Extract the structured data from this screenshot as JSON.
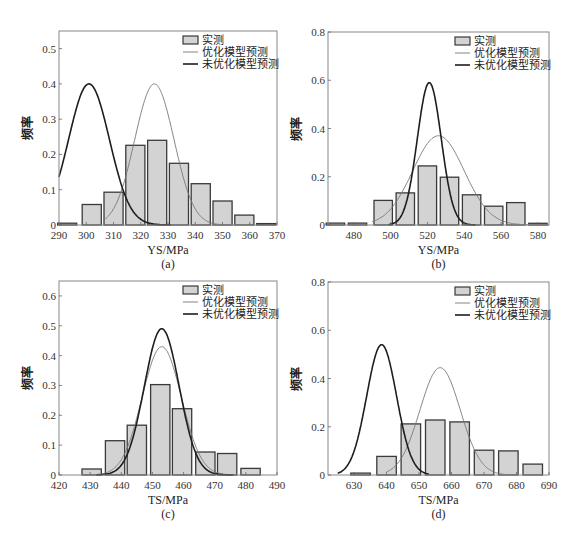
{
  "figure": {
    "legend": {
      "measured": "实测",
      "optimized": "优化模型预测",
      "unoptimized": "未优化模型预测"
    },
    "ylabel": "频率"
  },
  "chart_data": [
    {
      "id": "a",
      "type": "bar",
      "caption": "(a)",
      "xlabel": "YS/MPa",
      "ylabel": "频率",
      "xlim": [
        290,
        370
      ],
      "ylim": [
        0,
        0.55
      ],
      "xticks": [
        290,
        300,
        310,
        320,
        330,
        340,
        350,
        360,
        370
      ],
      "yticks": [
        0,
        0.1,
        0.2,
        0.3,
        0.4,
        0.5
      ],
      "ytick_labels": [
        "0",
        "0.1",
        "0.2",
        "0.3",
        "0.4",
        "0.5"
      ],
      "bar_width": 7,
      "bars": {
        "x": [
          293,
          302,
          310,
          318,
          326,
          334,
          342,
          350,
          358,
          366
        ],
        "values": [
          0.005,
          0.058,
          0.093,
          0.226,
          0.24,
          0.175,
          0.117,
          0.068,
          0.028,
          0.004
        ]
      },
      "series": [
        {
          "name": "优化模型预测",
          "type": "line",
          "mean": 325,
          "peak": 0.4,
          "sigma": 7.2,
          "range": [
            307,
            356
          ]
        },
        {
          "name": "未优化模型预测",
          "type": "line",
          "mean": 301,
          "peak": 0.4,
          "sigma": 7.5,
          "range": [
            290,
            331
          ]
        }
      ],
      "legend_position": "upper right",
      "grid": false
    },
    {
      "id": "b",
      "type": "bar",
      "caption": "(b)",
      "xlabel": "YS/MPa",
      "ylabel": "频率",
      "xlim": [
        466,
        586
      ],
      "ylim": [
        0,
        0.8
      ],
      "xticks": [
        480,
        500,
        520,
        540,
        560,
        580
      ],
      "yticks": [
        0,
        0.2,
        0.4,
        0.6,
        0.8
      ],
      "ytick_labels": [
        "0",
        "0.2",
        "0.4",
        "0.6",
        "0.8"
      ],
      "bar_width": 10,
      "bars": {
        "x": [
          470,
          482,
          496,
          508,
          520,
          532,
          544,
          556,
          568,
          580
        ],
        "values": [
          0.008,
          0.008,
          0.102,
          0.133,
          0.245,
          0.198,
          0.125,
          0.078,
          0.093,
          0.007
        ]
      },
      "series": [
        {
          "name": "优化模型预测",
          "type": "line",
          "mean": 526,
          "peak": 0.37,
          "sigma": 14,
          "range": [
            490,
            586
          ]
        },
        {
          "name": "未优化模型预测",
          "type": "line",
          "mean": 521,
          "peak": 0.59,
          "sigma": 6.5,
          "range": [
            499,
            546
          ]
        }
      ],
      "legend_position": "upper right",
      "grid": false
    },
    {
      "id": "c",
      "type": "bar",
      "caption": "(c)",
      "xlabel": "TS/MPa",
      "ylabel": "频率",
      "xlim": [
        420,
        490
      ],
      "ylim": [
        0,
        0.65
      ],
      "xticks": [
        420,
        430,
        440,
        450,
        460,
        470,
        480,
        490
      ],
      "yticks": [
        0,
        0.1,
        0.2,
        0.3,
        0.4,
        0.5,
        0.6
      ],
      "ytick_labels": [
        "0",
        "0.1",
        "0.2",
        "0.3",
        "0.4",
        "0.5",
        "0.6"
      ],
      "bar_width": 6.2,
      "bars": {
        "x": [
          430.5,
          438,
          445,
          452.5,
          459.5,
          467,
          474,
          481.5
        ],
        "values": [
          0.02,
          0.115,
          0.167,
          0.303,
          0.222,
          0.077,
          0.072,
          0.022
        ]
      },
      "series": [
        {
          "name": "优化模型预测",
          "type": "line",
          "mean": 453,
          "peak": 0.43,
          "sigma": 6.3,
          "range": [
            432,
            476
          ]
        },
        {
          "name": "未优化模型预测",
          "type": "line",
          "mean": 453,
          "peak": 0.49,
          "sigma": 5.6,
          "range": [
            432,
            476
          ]
        }
      ],
      "legend_position": "upper right",
      "grid": false
    },
    {
      "id": "d",
      "type": "bar",
      "caption": "(d)",
      "xlabel": "TS/MPa",
      "ylabel": "频率",
      "xlim": [
        622,
        690
      ],
      "ylim": [
        0,
        0.8
      ],
      "xticks": [
        630,
        640,
        650,
        660,
        670,
        680,
        690
      ],
      "yticks": [
        0,
        0.2,
        0.4,
        0.6,
        0.8
      ],
      "ytick_labels": [
        "0",
        "0.2",
        "0.4",
        "0.6",
        "0.8"
      ],
      "bar_width": 6,
      "bars": {
        "x": [
          632,
          640,
          647.5,
          655,
          662.5,
          670,
          677.5,
          685
        ],
        "values": [
          0.008,
          0.077,
          0.212,
          0.228,
          0.22,
          0.103,
          0.1,
          0.045
        ]
      },
      "series": [
        {
          "name": "优化模型预测",
          "type": "line",
          "mean": 656.5,
          "peak": 0.445,
          "sigma": 6.2,
          "range": [
            640,
            678
          ]
        },
        {
          "name": "未优化模型预测",
          "type": "line",
          "mean": 638.5,
          "peak": 0.54,
          "sigma": 4.6,
          "range": [
            625,
            653
          ]
        }
      ],
      "legend_position": "upper right",
      "grid": false
    }
  ]
}
